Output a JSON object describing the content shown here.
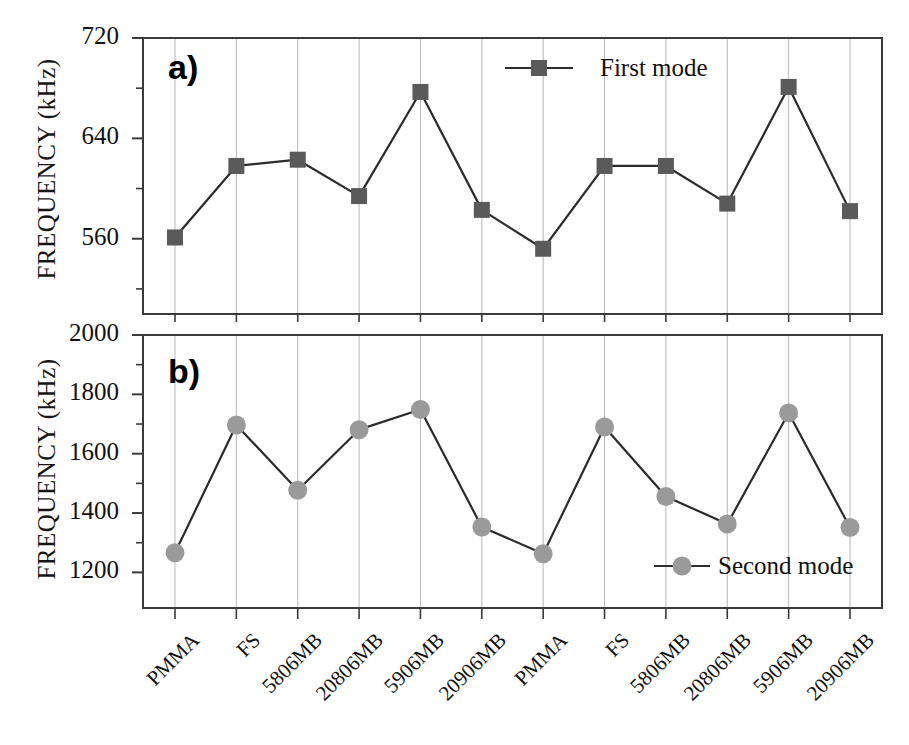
{
  "figure": {
    "background": "#ffffff",
    "line_color": "#2b2b2b",
    "axis_color": "#3a3a3a",
    "grid_color": "#b8b8b8",
    "first_mode_marker_color": "#5a5a5a",
    "second_mode_marker_color": "#9a9a9a"
  },
  "panel_a": {
    "letter": "a)",
    "ylabel": "FREQUENCY (kHz)",
    "legend_label": "First mode",
    "ytick_labels": [
      "720",
      "640",
      "560"
    ]
  },
  "panel_b": {
    "letter": "b)",
    "ylabel": "FREQUENCY (kHz)",
    "legend_label": "Second mode",
    "ytick_labels": [
      "2000",
      "1800",
      "1600",
      "1400",
      "1200"
    ]
  },
  "chart_data": [
    {
      "type": "line",
      "title": "a)",
      "xlabel": "",
      "ylabel": "FREQUENCY (kHz)",
      "ylim": [
        500,
        720
      ],
      "yticks": [
        560,
        640,
        720
      ],
      "yminorticks": [
        520,
        600,
        680
      ],
      "grid": true,
      "legend": "First mode",
      "legend_position": "top-center-right",
      "categories": [
        "PMMA",
        "FS",
        "5806MB",
        "20806MB",
        "5906MB",
        "20906MB",
        "PMMA",
        "FS",
        "5806MB",
        "20806MB",
        "5906MB",
        "20906MB"
      ],
      "series": [
        {
          "name": "First mode",
          "marker": "square",
          "color": "#5a5a5a",
          "values": [
            561,
            618,
            623,
            594,
            677,
            583,
            552,
            618,
            618,
            588,
            681,
            582
          ]
        }
      ]
    },
    {
      "type": "line",
      "title": "b)",
      "xlabel": "",
      "ylabel": "FREQUENCY (kHz)",
      "ylim": [
        1080,
        2000
      ],
      "yticks": [
        1200,
        1400,
        1600,
        1800,
        2000
      ],
      "yminorticks": [
        1300,
        1500,
        1700,
        1900
      ],
      "grid": true,
      "legend": "Second mode",
      "legend_position": "bottom-center-right",
      "categories": [
        "PMMA",
        "FS",
        "5806MB",
        "20806MB",
        "5906MB",
        "20906MB",
        "PMMA",
        "FS",
        "5806MB",
        "20806MB",
        "5906MB",
        "20906MB"
      ],
      "series": [
        {
          "name": "Second mode",
          "marker": "circle",
          "color": "#9a9a9a",
          "values": [
            1266,
            1697,
            1477,
            1681,
            1749,
            1353,
            1263,
            1690,
            1456,
            1363,
            1737,
            1351
          ]
        }
      ]
    }
  ],
  "xaxis": {
    "tick_labels": [
      "PMMA",
      "FS",
      "5806MB",
      "20806MB",
      "5906MB",
      "20906MB",
      "PMMA",
      "FS",
      "5806MB",
      "20806MB",
      "5906MB",
      "20906MB"
    ]
  }
}
